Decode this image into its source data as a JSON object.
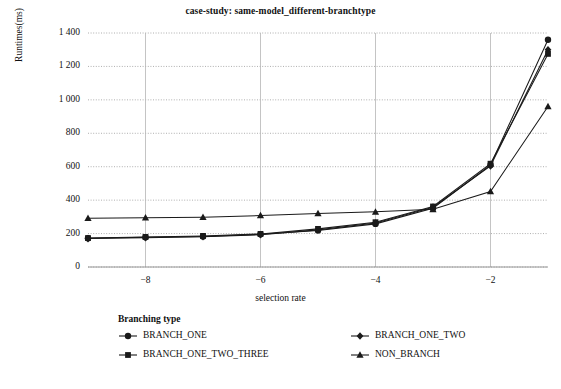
{
  "chart_data": {
    "type": "line",
    "title": "case-study: same-model_different-branchtype",
    "xlabel": "selection rate",
    "ylabel": "Runtimes(ms)",
    "xlim": [
      -9,
      -1
    ],
    "ylim": [
      0,
      1400
    ],
    "grid": true,
    "legend_position": "bottom",
    "legend_title": "Branching type",
    "x": [
      -9,
      -8,
      -7,
      -6,
      -5,
      -4,
      -3,
      -2,
      -1
    ],
    "xticks": [
      -8,
      -6,
      -4,
      -2
    ],
    "xtick_labels": [
      "−8",
      "−6",
      "−4",
      "−2"
    ],
    "yticks": [
      0,
      200,
      400,
      600,
      800,
      1000,
      1200,
      1400
    ],
    "ytick_labels": [
      "0",
      "200",
      "400",
      "600",
      "800",
      "1 000",
      "1 200",
      "1 400"
    ],
    "series": [
      {
        "name": "BRANCH_ONE",
        "marker": "circle",
        "color": "#1a1a1a",
        "values": [
          172,
          178,
          183,
          196,
          219,
          258,
          352,
          610,
          1360
        ]
      },
      {
        "name": "BRANCH_ONE_TWO",
        "marker": "diamond",
        "color": "#1a1a1a",
        "values": [
          170,
          175,
          181,
          193,
          222,
          263,
          358,
          605,
          1300
        ]
      },
      {
        "name": "BRANCH_ONE_TWO_THREE",
        "marker": "square",
        "color": "#1a1a1a",
        "values": [
          173,
          180,
          186,
          198,
          228,
          268,
          362,
          618,
          1275
        ]
      },
      {
        "name": "NON_BRANCH",
        "marker": "triangle",
        "color": "#1a1a1a",
        "values": [
          292,
          295,
          298,
          308,
          320,
          330,
          345,
          452,
          960
        ]
      }
    ]
  }
}
